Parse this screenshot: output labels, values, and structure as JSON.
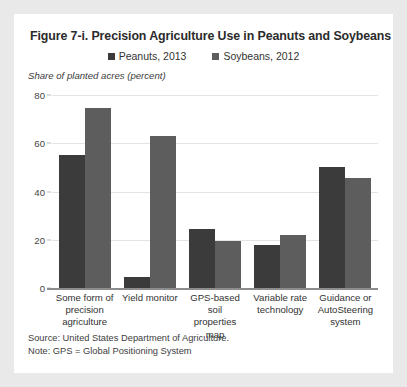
{
  "chart_data": {
    "type": "bar",
    "title": "Figure 7-i. Precision Agriculture Use in Peanuts and Soybeans",
    "subtitle": "",
    "ylabel": "Share of planted acres (percent)",
    "xlabel": "",
    "ylim": [
      0,
      80
    ],
    "yticks": [
      0,
      20,
      40,
      60,
      80
    ],
    "ytick_labels": [
      "0",
      "20",
      "40",
      "60",
      "80"
    ],
    "grid": true,
    "legend_position": "top-center",
    "categories": [
      "Some form of precision agriculture",
      "Yield monitor",
      "GPS-based soil properties map",
      "Variable rate technology",
      "Guidance or AutoSteering system"
    ],
    "series": [
      {
        "name": "Peanuts, 2013",
        "color": "#3b3b3b",
        "values": [
          55,
          4.5,
          24.5,
          18,
          50
        ]
      },
      {
        "name": "Soybeans, 2012",
        "color": "#5d5d5d",
        "values": [
          74.5,
          63,
          19.5,
          22,
          45.5
        ]
      }
    ],
    "source": "Source: United States Department of Agriculture.",
    "note": "Note: GPS = Global Positioning System"
  },
  "xlabel_lines": [
    [
      "Some form of",
      "precision",
      "agriculture"
    ],
    [
      "Yield monitor"
    ],
    [
      "GPS-based soil",
      "properties",
      "map"
    ],
    [
      "Variable rate",
      "technology"
    ],
    [
      "Guidance or",
      "AutoSteering",
      "system"
    ]
  ],
  "colors": {
    "page_background": "#e9e9e9",
    "card_background": "#ffffff",
    "peanuts": "#3b3b3b",
    "soybeans": "#5d5d5d",
    "gridline": "#e3e3e3",
    "axis": "#8d8d8d",
    "text": "#2b2b2b"
  }
}
